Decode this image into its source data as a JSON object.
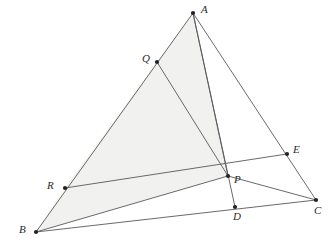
{
  "figure": {
    "canvas": {
      "width": 335,
      "height": 252
    },
    "background_color": "#ffffff",
    "shading_color": "#f1f1ef",
    "line_color": "#595959",
    "vertex_color": "#232323",
    "points": [
      {
        "id": "A",
        "label": "A",
        "x": 193,
        "y": 13,
        "label_x": 201,
        "label_y": 4
      },
      {
        "id": "Q",
        "label": "Q",
        "x": 157,
        "y": 62,
        "label_x": 142,
        "label_y": 53
      },
      {
        "id": "R",
        "label": "R",
        "x": 65,
        "y": 188,
        "label_x": 47,
        "label_y": 180
      },
      {
        "id": "B",
        "label": "B",
        "x": 36,
        "y": 232,
        "label_x": 19,
        "label_y": 224
      },
      {
        "id": "P",
        "label": "P",
        "x": 228,
        "y": 176,
        "label_x": 234,
        "label_y": 174
      },
      {
        "id": "D",
        "label": "D",
        "x": 235,
        "y": 207,
        "label_x": 233,
        "label_y": 211
      },
      {
        "id": "C",
        "label": "C",
        "x": 316,
        "y": 200,
        "label_x": 314,
        "label_y": 205
      },
      {
        "id": "E",
        "label": "E",
        "x": 287,
        "y": 154,
        "label_x": 293,
        "label_y": 144
      }
    ],
    "segments": [
      {
        "id": "AB",
        "from": "A",
        "to": "B",
        "note": "side AB through Q and R"
      },
      {
        "id": "BC",
        "from": "B",
        "to": "C",
        "note": "side BC through D"
      },
      {
        "id": "CA",
        "from": "C",
        "to": "A",
        "note": "side CA through E"
      },
      {
        "id": "AD",
        "from": "A",
        "to": "D",
        "note": "cevian A to D through P"
      },
      {
        "id": "AP",
        "from": "A",
        "to": "P",
        "note": "cevian segment"
      },
      {
        "id": "QP",
        "from": "Q",
        "to": "P",
        "note": "segment from Q to P"
      },
      {
        "id": "RE",
        "from": "R",
        "to": "E",
        "note": "line R through P to E"
      },
      {
        "id": "BP",
        "from": "B",
        "to": "P",
        "note": "segment from B to P"
      },
      {
        "id": "PC",
        "from": "P",
        "to": "C",
        "note": "segment P to C region edge"
      }
    ],
    "shaded_region": {
      "id": "shaded-polygon",
      "vertices": [
        "A",
        "Q",
        "R",
        "B",
        "P"
      ],
      "note": "light gray shaded region bounded by AB, BP, PA"
    },
    "vertex_dot_radius": 2.1
  }
}
